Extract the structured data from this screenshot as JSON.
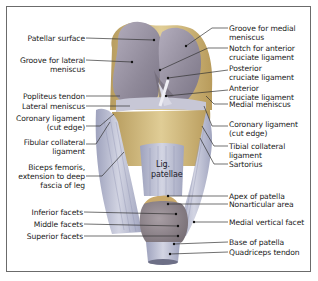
{
  "diagram": {
    "center_labels": {
      "lig_patellae_line1": "Lig.",
      "lig_patellae_line2": "patellae"
    },
    "left_labels": [
      {
        "lines": [
          "Patellar surface"
        ]
      },
      {
        "lines": [
          "Groove for lateral",
          "meniscus"
        ]
      },
      {
        "lines": [
          "Popliteus tendon"
        ]
      },
      {
        "lines": [
          "Lateral meniscus"
        ]
      },
      {
        "lines": [
          "Coronary ligament",
          "(cut edge)"
        ]
      },
      {
        "lines": [
          "Fibular collateral",
          "ligament"
        ]
      },
      {
        "lines": [
          "Biceps femoris,",
          "extension to deep",
          "fascia of leg"
        ]
      },
      {
        "lines": [
          "Inferior facets"
        ]
      },
      {
        "lines": [
          "Middle facets"
        ]
      },
      {
        "lines": [
          "Superior facets"
        ]
      }
    ],
    "right_labels": [
      {
        "lines": [
          "Groove for medial",
          "meniscus"
        ]
      },
      {
        "lines": [
          "Notch for anterior",
          "cruciate ligament"
        ]
      },
      {
        "lines": [
          "Posterior",
          "cruciate ligament"
        ]
      },
      {
        "lines": [
          "Anterior",
          "cruciate ligament"
        ]
      },
      {
        "lines": [
          "Medial meniscus"
        ]
      },
      {
        "lines": [
          "Coronary ligament",
          "(cut edge)"
        ]
      },
      {
        "lines": [
          "Tibial collateral",
          "ligament"
        ]
      },
      {
        "lines": [
          "Sartorius"
        ]
      },
      {
        "lines": [
          "Apex of patella"
        ]
      },
      {
        "lines": [
          "Nonarticular area"
        ]
      },
      {
        "lines": [
          "Medial vertical facet"
        ]
      },
      {
        "lines": [
          "Base of patella"
        ]
      },
      {
        "lines": [
          "Quadriceps tendon"
        ]
      }
    ],
    "colors": {
      "frame": "#6b6b6b",
      "femur_cartilage": "#9c96a6",
      "bone": "#c9b27a",
      "ligament": "#b9bccf",
      "leader_line": "#333333",
      "text": "#222222"
    }
  }
}
